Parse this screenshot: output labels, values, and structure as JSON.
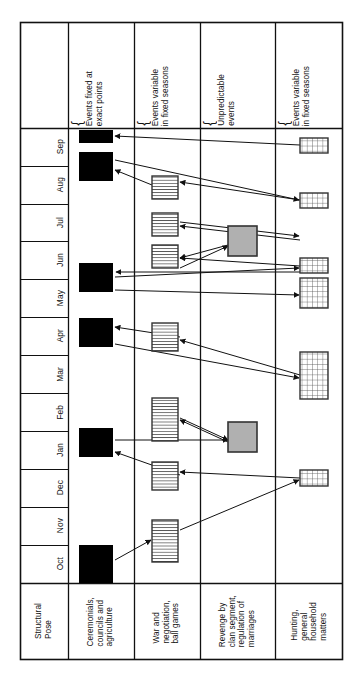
{
  "figure": {
    "type": "timeline-matrix-diagram",
    "orientation": "rotated-90-ccw",
    "columns": [
      {
        "id": "structural-pose",
        "header": "",
        "footer": "Structural\nPose",
        "x0": 20,
        "x1": 68
      },
      {
        "id": "ceremonials",
        "header": "Events fixed at\nexact points",
        "footer": "Ceremonials,\ncouncils and\nagriculture",
        "x0": 68,
        "x1": 134
      },
      {
        "id": "war-negotiation",
        "header": "Events variable\nin fixed seasons",
        "footer": "War and\nnegotiation,\nball games",
        "x0": 134,
        "x1": 200
      },
      {
        "id": "revenge",
        "header": "Unpredictable\nevents",
        "footer": "Revenge by\nclan segment,\nregulation of\nmarriages",
        "x0": 200,
        "x1": 275
      },
      {
        "id": "hunting",
        "header": "Events variable\nin fixed seasons",
        "footer": "Hunting,\ngeneral\nhousehold\nmatters",
        "x0": 275,
        "x1": 343
      }
    ],
    "months": [
      {
        "label": "Sep",
        "y0": 128,
        "y1": 166
      },
      {
        "label": "Aug",
        "y0": 166,
        "y1": 204
      },
      {
        "label": "Jul",
        "y0": 204,
        "y1": 241
      },
      {
        "label": "Jun",
        "y0": 241,
        "y1": 279
      },
      {
        "label": "May",
        "y0": 279,
        "y1": 317
      },
      {
        "label": "Apr",
        "y0": 317,
        "y1": 355
      },
      {
        "label": "Mar",
        "y0": 355,
        "y1": 393
      },
      {
        "label": "Feb",
        "y0": 393,
        "y1": 431
      },
      {
        "label": "Jan",
        "y0": 431,
        "y1": 469
      },
      {
        "label": "Dec",
        "y0": 469,
        "y1": 507
      },
      {
        "label": "Nov",
        "y0": 507,
        "y1": 545
      },
      {
        "label": "Oct",
        "y0": 545,
        "y1": 583
      }
    ],
    "brace_glyph": "{",
    "frame": {
      "x0": 20,
      "y0": 22,
      "x1": 343,
      "y1": 660,
      "header_y1": 128,
      "footer_y0": 583
    },
    "legend_styles": {
      "solid_black": "#000000",
      "gray_fill": "#b0b0b0",
      "striped_fill": "#ffffff",
      "grid_fill": "#ffffff",
      "stroke": "#111111"
    },
    "events": [
      {
        "id": "c2-e1",
        "col": "ceremonials",
        "style": "solid-black",
        "x": 79,
        "y": 130,
        "w": 34,
        "h": 13
      },
      {
        "id": "c2-e2",
        "col": "ceremonials",
        "style": "solid-black",
        "x": 79,
        "y": 152,
        "w": 34,
        "h": 29
      },
      {
        "id": "c2-e3",
        "col": "ceremonials",
        "style": "solid-black",
        "x": 79,
        "y": 263,
        "w": 34,
        "h": 29
      },
      {
        "id": "c2-e4",
        "col": "ceremonials",
        "style": "solid-black",
        "x": 79,
        "y": 318,
        "w": 34,
        "h": 29
      },
      {
        "id": "c2-e5",
        "col": "ceremonials",
        "style": "solid-black",
        "x": 79,
        "y": 428,
        "w": 34,
        "h": 29
      },
      {
        "id": "c2-e6",
        "col": "ceremonials",
        "style": "solid-black",
        "x": 79,
        "y": 545,
        "w": 34,
        "h": 38
      },
      {
        "id": "c3-e1",
        "col": "war-negotiation",
        "style": "striped",
        "x": 152,
        "y": 176,
        "w": 26,
        "h": 23
      },
      {
        "id": "c3-e2",
        "col": "war-negotiation",
        "style": "striped",
        "x": 152,
        "y": 213,
        "w": 26,
        "h": 23
      },
      {
        "id": "c3-e3",
        "col": "war-negotiation",
        "style": "striped",
        "x": 152,
        "y": 245,
        "w": 26,
        "h": 23
      },
      {
        "id": "c3-e4",
        "col": "war-negotiation",
        "style": "striped",
        "x": 152,
        "y": 323,
        "w": 26,
        "h": 28
      },
      {
        "id": "c3-e5",
        "col": "war-negotiation",
        "style": "striped",
        "x": 152,
        "y": 398,
        "w": 26,
        "h": 43
      },
      {
        "id": "c3-e6",
        "col": "war-negotiation",
        "style": "striped",
        "x": 152,
        "y": 462,
        "w": 26,
        "h": 28
      },
      {
        "id": "c3-e7",
        "col": "war-negotiation",
        "style": "striped",
        "x": 152,
        "y": 520,
        "w": 26,
        "h": 42
      },
      {
        "id": "c4-e1",
        "col": "revenge",
        "style": "gray",
        "x": 228,
        "y": 226,
        "w": 29,
        "h": 30
      },
      {
        "id": "c4-e2",
        "col": "revenge",
        "style": "gray",
        "x": 228,
        "y": 422,
        "w": 29,
        "h": 30
      },
      {
        "id": "c5-e1",
        "col": "hunting",
        "style": "grid",
        "x": 300,
        "y": 138,
        "w": 28,
        "h": 15
      },
      {
        "id": "c5-e2",
        "col": "hunting",
        "style": "grid",
        "x": 300,
        "y": 193,
        "w": 28,
        "h": 15
      },
      {
        "id": "c5-e3",
        "col": "hunting",
        "style": "grid",
        "x": 300,
        "y": 258,
        "w": 28,
        "h": 15
      },
      {
        "id": "c5-e4",
        "col": "hunting",
        "style": "grid",
        "x": 300,
        "y": 278,
        "w": 28,
        "h": 30
      },
      {
        "id": "c5-e5",
        "col": "hunting",
        "style": "grid",
        "x": 300,
        "y": 352,
        "w": 28,
        "h": 47
      },
      {
        "id": "c5-e6",
        "col": "hunting",
        "style": "grid",
        "x": 300,
        "y": 470,
        "w": 28,
        "h": 16
      }
    ],
    "arrows": [
      {
        "id": "a1",
        "from": [
          300,
          145
        ],
        "to": [
          115,
          136
        ]
      },
      {
        "id": "a2",
        "from": [
          115,
          160
        ],
        "to": [
          299,
          200
        ]
      },
      {
        "id": "a3",
        "from": [
          152,
          185
        ],
        "to": [
          115,
          170
        ]
      },
      {
        "id": "a4",
        "from": [
          300,
          200
        ],
        "to": [
          180,
          182
        ]
      },
      {
        "id": "a5",
        "from": [
          180,
          222
        ],
        "to": [
          299,
          236
        ]
      },
      {
        "id": "a6",
        "from": [
          300,
          240
        ],
        "to": [
          180,
          226
        ]
      },
      {
        "id": "a7",
        "from": [
          228,
          245
        ],
        "to": [
          180,
          258
        ]
      },
      {
        "id": "a8",
        "from": [
          180,
          268
        ],
        "to": [
          228,
          246
        ]
      },
      {
        "id": "a9",
        "from": [
          300,
          266
        ],
        "to": [
          180,
          258
        ]
      },
      {
        "id": "a10",
        "from": [
          115,
          277
        ],
        "to": [
          299,
          268
        ]
      },
      {
        "id": "a11",
        "from": [
          300,
          272
        ],
        "to": [
          116,
          272
        ]
      },
      {
        "id": "a12",
        "from": [
          115,
          290
        ],
        "to": [
          299,
          295
        ]
      },
      {
        "id": "a13",
        "from": [
          180,
          337
        ],
        "to": [
          115,
          327
        ]
      },
      {
        "id": "a14",
        "from": [
          115,
          344
        ],
        "to": [
          299,
          378
        ]
      },
      {
        "id": "a15",
        "from": [
          300,
          375
        ],
        "to": [
          180,
          340
        ]
      },
      {
        "id": "a16",
        "from": [
          180,
          418
        ],
        "to": [
          228,
          440
        ]
      },
      {
        "id": "a17",
        "from": [
          228,
          442
        ],
        "to": [
          180,
          420
        ]
      },
      {
        "id": "a18",
        "from": [
          115,
          440
        ],
        "to": [
          228,
          440
        ]
      },
      {
        "id": "a19",
        "from": [
          180,
          475
        ],
        "to": [
          115,
          452
        ]
      },
      {
        "id": "a20",
        "from": [
          300,
          478
        ],
        "to": [
          180,
          472
        ]
      },
      {
        "id": "a21",
        "from": [
          180,
          530
        ],
        "to": [
          299,
          480
        ]
      },
      {
        "id": "a22",
        "from": [
          115,
          560
        ],
        "to": [
          151,
          540
        ]
      }
    ]
  }
}
